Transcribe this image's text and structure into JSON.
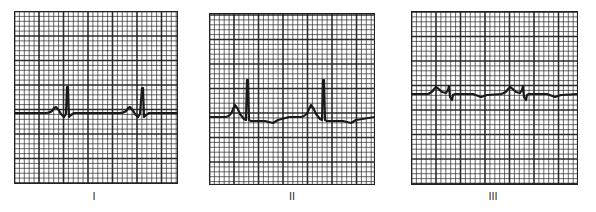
{
  "figure": {
    "grid_color": "#222222",
    "trace_color": "#1a1a1a",
    "background": "#ffffff",
    "panels": [
      {
        "label": "I",
        "beats": 2,
        "p_wave": "upright",
        "qrs": "tall narrow upright R with small S",
        "t_wave": "flat"
      },
      {
        "label": "II",
        "beats": 2,
        "p_wave": "upright, prominent",
        "qrs": "tall narrow upright R",
        "t_wave": "shallow inverted"
      },
      {
        "label": "III",
        "beats": 2,
        "p_wave": "upright, small",
        "qrs": "low amplitude, biphasic",
        "t_wave": "shallow inverted"
      }
    ]
  }
}
